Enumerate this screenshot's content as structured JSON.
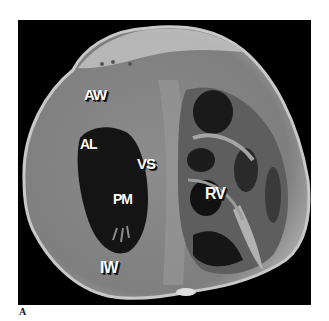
{
  "figure": {
    "panel_label": "A",
    "labels": {
      "aw": "AW",
      "al": "AL",
      "vs": "VS",
      "pm": "PM",
      "rv": "RV",
      "iw": "IW"
    },
    "colors": {
      "background": "#000000",
      "myocardium": "#8a8a8a",
      "highlight": "#bdbdbd",
      "cavity": "#141414",
      "label_text": "#ffffff"
    }
  }
}
